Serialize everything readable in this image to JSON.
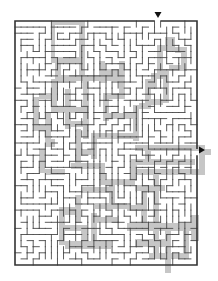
{
  "puzzle": {
    "type": "maze",
    "colors": {
      "background": "#ffffff",
      "wall": "#4a4a4a",
      "border": "#333333",
      "solution_shade": "#c6c6c6",
      "arrow": "#111111"
    },
    "frame": {
      "x": 15,
      "y": 21,
      "width": 182,
      "height": 244
    },
    "grid": {
      "cols": 30,
      "rows": 40,
      "seed": 20240611
    },
    "entry": {
      "side": "top",
      "col": 23,
      "arrow_x": 158,
      "arrow_y": 12,
      "icon": "down-triangle-arrow"
    },
    "exit": {
      "side": "right",
      "row": 21,
      "arrow_x": 199,
      "arrow_y": 150,
      "icon": "right-triangle-arrow"
    },
    "shaded_regions": [
      [
        36,
        12,
        64,
        12,
        64,
        16,
        40,
        16,
        40,
        52,
        36,
        52
      ],
      [
        64,
        12,
        70,
        12,
        70,
        70,
        64,
        70
      ],
      [
        36,
        48,
        64,
        48,
        64,
        54,
        36,
        54
      ],
      [
        40,
        52,
        46,
        52,
        46,
        70,
        40,
        70
      ],
      [
        40,
        66,
        110,
        66,
        110,
        72,
        40,
        72
      ],
      [
        36,
        70,
        42,
        70,
        42,
        104,
        36,
        104
      ],
      [
        24,
        84,
        42,
        84,
        42,
        90,
        24,
        90
      ],
      [
        18,
        88,
        24,
        88,
        24,
        120,
        18,
        120
      ],
      [
        18,
        116,
        34,
        116,
        34,
        122,
        18,
        122
      ],
      [
        30,
        104,
        36,
        104,
        36,
        136,
        30,
        136
      ],
      [
        30,
        130,
        40,
        130,
        40,
        138,
        30,
        138
      ],
      [
        36,
        98,
        70,
        98,
        70,
        104,
        36,
        104
      ],
      [
        50,
        80,
        56,
        80,
        56,
        120,
        50,
        120
      ],
      [
        50,
        112,
        74,
        112,
        74,
        118,
        50,
        118
      ],
      [
        68,
        72,
        74,
        72,
        74,
        130,
        68,
        130
      ],
      [
        84,
        52,
        90,
        52,
        90,
        74,
        84,
        74
      ],
      [
        90,
        60,
        104,
        60,
        104,
        66,
        90,
        66
      ],
      [
        104,
        52,
        110,
        52,
        110,
        90,
        104,
        90
      ],
      [
        88,
        84,
        110,
        84,
        110,
        90,
        88,
        90
      ],
      [
        88,
        88,
        94,
        88,
        94,
        112,
        88,
        112
      ],
      [
        94,
        104,
        124,
        104,
        124,
        110,
        94,
        110
      ],
      [
        118,
        96,
        124,
        96,
        124,
        132,
        118,
        132
      ],
      [
        124,
        94,
        136,
        94,
        136,
        100,
        124,
        100
      ],
      [
        130,
        70,
        136,
        70,
        136,
        98,
        130,
        98
      ],
      [
        136,
        64,
        142,
        64,
        142,
        80,
        136,
        80
      ],
      [
        142,
        36,
        148,
        36,
        148,
        70,
        142,
        70
      ],
      [
        142,
        36,
        160,
        36,
        160,
        42,
        142,
        42
      ],
      [
        150,
        28,
        160,
        28,
        160,
        36,
        150,
        36
      ],
      [
        160,
        38,
        172,
        38,
        172,
        44,
        160,
        44
      ],
      [
        166,
        40,
        172,
        40,
        172,
        60,
        166,
        60
      ],
      [
        154,
        56,
        172,
        56,
        172,
        62,
        154,
        62
      ],
      [
        148,
        60,
        154,
        60,
        154,
        94,
        148,
        94
      ],
      [
        136,
        90,
        148,
        90,
        148,
        96,
        136,
        96
      ],
      [
        76,
        124,
        124,
        124,
        124,
        130,
        76,
        130
      ],
      [
        76,
        124,
        82,
        124,
        82,
        150,
        76,
        150
      ],
      [
        60,
        140,
        80,
        140,
        80,
        146,
        60,
        146
      ],
      [
        60,
        120,
        66,
        120,
        66,
        160,
        60,
        160
      ],
      [
        56,
        154,
        90,
        154,
        90,
        160,
        56,
        160
      ],
      [
        84,
        156,
        90,
        156,
        90,
        176,
        84,
        176
      ],
      [
        84,
        170,
        120,
        170,
        120,
        176,
        84,
        176
      ],
      [
        116,
        150,
        122,
        150,
        122,
        172,
        116,
        172
      ],
      [
        116,
        150,
        180,
        150,
        180,
        156,
        116,
        156
      ],
      [
        120,
        160,
        190,
        160,
        190,
        166,
        120,
        166
      ],
      [
        184,
        140,
        190,
        140,
        190,
        166,
        184,
        166
      ],
      [
        184,
        140,
        196,
        140,
        196,
        146,
        184,
        146
      ],
      [
        130,
        136,
        136,
        136,
        136,
        156,
        130,
        156
      ],
      [
        120,
        136,
        190,
        136,
        190,
        142,
        120,
        142
      ],
      [
        138,
        166,
        144,
        166,
        144,
        250,
        138,
        250
      ],
      [
        120,
        176,
        150,
        176,
        150,
        182,
        120,
        182
      ],
      [
        126,
        182,
        132,
        182,
        132,
        220,
        126,
        220
      ],
      [
        112,
        196,
        132,
        196,
        132,
        202,
        112,
        202
      ],
      [
        112,
        214,
        176,
        214,
        176,
        222,
        112,
        222
      ],
      [
        150,
        220,
        156,
        220,
        156,
        264,
        150,
        264
      ],
      [
        134,
        244,
        174,
        244,
        174,
        250,
        134,
        250
      ],
      [
        168,
        222,
        174,
        222,
        174,
        246,
        168,
        246
      ],
      [
        176,
        206,
        184,
        206,
        184,
        232,
        176,
        232
      ],
      [
        120,
        230,
        150,
        230,
        150,
        238,
        120,
        238
      ],
      [
        66,
        178,
        100,
        178,
        100,
        184,
        66,
        184
      ],
      [
        94,
        176,
        100,
        176,
        100,
        200,
        94,
        200
      ],
      [
        80,
        194,
        112,
        194,
        112,
        200,
        80,
        200
      ],
      [
        60,
        186,
        66,
        186,
        66,
        214,
        60,
        214
      ],
      [
        44,
        198,
        66,
        198,
        66,
        206,
        44,
        206
      ],
      [
        44,
        200,
        50,
        200,
        50,
        236,
        44,
        236
      ],
      [
        50,
        216,
        72,
        216,
        72,
        222,
        50,
        222
      ],
      [
        66,
        216,
        72,
        216,
        72,
        238,
        66,
        238
      ],
      [
        50,
        232,
        96,
        232,
        96,
        240,
        50,
        240
      ],
      [
        76,
        204,
        82,
        204,
        82,
        236,
        76,
        236
      ],
      [
        82,
        208,
        104,
        208,
        104,
        214,
        82,
        214
      ],
      [
        30,
        160,
        50,
        160,
        50,
        166,
        30,
        166
      ],
      [
        24,
        140,
        30,
        140,
        30,
        164,
        24,
        164
      ]
    ]
  }
}
